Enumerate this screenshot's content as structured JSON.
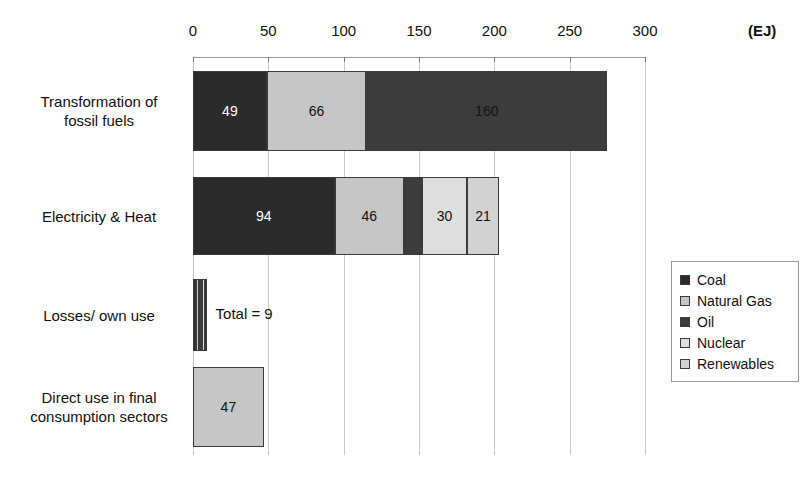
{
  "chart_data": {
    "type": "bar",
    "orientation": "horizontal",
    "stacked": true,
    "title": "",
    "xlabel": "(EJ)",
    "ylabel": "",
    "xlim": [
      0,
      300
    ],
    "xticks": [
      0,
      50,
      100,
      150,
      200,
      250,
      300
    ],
    "xtick_labels": [
      "0",
      "50",
      "100",
      "150",
      "200",
      "250",
      "300"
    ],
    "grid": true,
    "legend_position": "right",
    "categories": [
      "Transformation of fossil fuels",
      "Electricity & Heat",
      "Losses/ own use",
      "Direct use in final consumption sectors"
    ],
    "series": [
      {
        "name": "Coal",
        "color": "#2b2b2b",
        "values": [
          49,
          94,
          2,
          0
        ]
      },
      {
        "name": "Natural Gas",
        "color": "#c6c6c6",
        "values": [
          66,
          46,
          2,
          47
        ]
      },
      {
        "name": "Oil",
        "color": "#3c3c3c",
        "values": [
          160,
          12,
          2,
          0
        ]
      },
      {
        "name": "Nuclear",
        "color": "#dedede",
        "values": [
          0,
          30,
          2,
          0
        ]
      },
      {
        "name": "Renewables",
        "color": "#d2d2d2",
        "values": [
          0,
          21,
          1,
          0
        ]
      }
    ],
    "bars": [
      {
        "category": "Transformation of fossil fuels",
        "total": 275,
        "segments": [
          {
            "series": "Coal",
            "value": 49,
            "label": "49",
            "label_position": "inside",
            "label_color": "#ffffff"
          },
          {
            "series": "Natural Gas",
            "value": 66,
            "label": "66",
            "label_position": "inside",
            "label_color": "#111111"
          },
          {
            "series": "Oil",
            "value": 160,
            "label": "160",
            "label_position": "inside",
            "label_color": "#141414"
          }
        ]
      },
      {
        "category": "Electricity & Heat",
        "total": 203,
        "segments": [
          {
            "series": "Coal",
            "value": 94,
            "label": "94",
            "label_position": "inside",
            "label_color": "#ffffff"
          },
          {
            "series": "Natural Gas",
            "value": 46,
            "label": "46",
            "label_position": "inside",
            "label_color": "#111111"
          },
          {
            "series": "Oil",
            "value": 12,
            "label": "12",
            "label_position": "below",
            "label_color": "#111111"
          },
          {
            "series": "Nuclear",
            "value": 30,
            "label": "30",
            "label_position": "inside",
            "label_color": "#111111"
          },
          {
            "series": "Renewables",
            "value": 21,
            "label": "21",
            "label_position": "inside",
            "label_color": "#111111"
          }
        ]
      },
      {
        "category": "Losses/ own use",
        "total": 9,
        "annotation": "Total = 9",
        "segments": [
          {
            "series": "Coal",
            "value": 2,
            "label": "",
            "label_position": "none"
          },
          {
            "series": "Natural Gas",
            "value": 2,
            "label": "",
            "label_position": "none"
          },
          {
            "series": "Oil",
            "value": 2,
            "label": "",
            "label_position": "none"
          },
          {
            "series": "Nuclear",
            "value": 2,
            "label": "",
            "label_position": "none"
          },
          {
            "series": "Renewables",
            "value": 1,
            "label": "",
            "label_position": "none"
          }
        ]
      },
      {
        "category": "Direct use in final consumption sectors",
        "total": 47,
        "segments": [
          {
            "series": "Natural Gas",
            "value": 47,
            "label": "47",
            "label_position": "inside",
            "label_color": "#111111"
          }
        ]
      }
    ]
  },
  "axis": {
    "unit": "(EJ)",
    "ticks": [
      "0",
      "50",
      "100",
      "150",
      "200",
      "250",
      "300"
    ]
  },
  "category_labels": [
    {
      "line1": "Transformation of",
      "line2": "fossil fuels"
    },
    {
      "line1": "Electricity & Heat",
      "line2": ""
    },
    {
      "line1": "Losses/ own use",
      "line2": ""
    },
    {
      "line1": "Direct use in final",
      "line2": "consumption sectors"
    }
  ],
  "annotations": {
    "losses_total": "Total = 9",
    "oil_electricity_value": "12"
  },
  "legend": {
    "items": [
      {
        "label": "Coal",
        "color": "#2b2b2b"
      },
      {
        "label": "Natural Gas",
        "color": "#c6c6c6"
      },
      {
        "label": "Oil",
        "color": "#3c3c3c"
      },
      {
        "label": "Nuclear",
        "color": "#dedede"
      },
      {
        "label": "Renewables",
        "color": "#d2d2d2"
      }
    ]
  }
}
